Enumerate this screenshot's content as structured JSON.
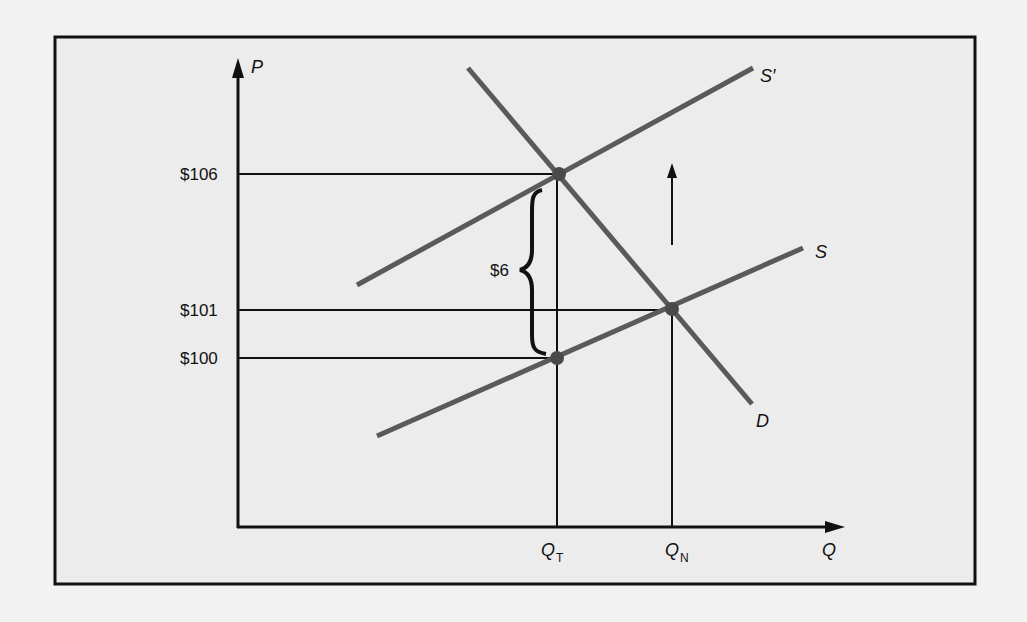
{
  "diagram": {
    "title": "",
    "axes": {
      "y_label": "P",
      "x_label": "Q"
    },
    "price_labels": [
      {
        "label": "$106",
        "value": 106
      },
      {
        "label": "$101",
        "value": 101
      },
      {
        "label": "$100",
        "value": 100
      }
    ],
    "quantity_labels": [
      {
        "main": "Q",
        "sub": "T"
      },
      {
        "main": "Q",
        "sub": "N"
      }
    ],
    "curves": [
      {
        "name": "D",
        "label": "D"
      },
      {
        "name": "S",
        "label": "S"
      },
      {
        "name": "S-prime",
        "label": "S′"
      }
    ],
    "tax_wedge": {
      "label": "$6"
    },
    "colors": {
      "curve": "#5a5a5a",
      "axis": "#111111",
      "frame_bg": "#ececec",
      "page_bg": "#f2f2f2"
    }
  }
}
